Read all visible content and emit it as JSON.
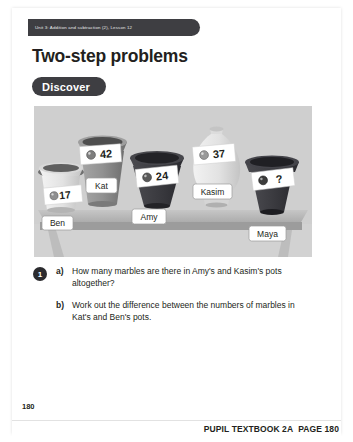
{
  "document": {
    "unit_strip": "Unit 3: Addition and subtraction (2), Lesson 12",
    "title": "Two-step problems",
    "section_label": "Discover",
    "folio": "180",
    "footer_book": "PUPIL TEXTBOOK 2A",
    "footer_page": "PAGE 180"
  },
  "illustration": {
    "name": "marble-pots-on-shelf",
    "pots": [
      {
        "id": "ben",
        "name_label": "Ben",
        "count_label": "17",
        "marble_icon": "marble-icon"
      },
      {
        "id": "kat",
        "name_label": "Kat",
        "count_label": "42",
        "marble_icon": "marble-icon"
      },
      {
        "id": "amy",
        "name_label": "Amy",
        "count_label": "24",
        "marble_icon": "marble-icon"
      },
      {
        "id": "kasim",
        "name_label": "Kasim",
        "count_label": "37",
        "marble_icon": "marble-icon"
      },
      {
        "id": "maya",
        "name_label": "Maya",
        "count_label": "?",
        "marble_icon": "marble-icon"
      }
    ]
  },
  "questions": {
    "number": "1",
    "items": [
      {
        "letter": "a)",
        "text": "How many marbles are there in Amy's and Kasim's pots altogether?"
      },
      {
        "letter": "b)",
        "text": "Work out the difference between the numbers of marbles in Kat's and Ben's pots."
      }
    ]
  },
  "colors": {
    "ink": "#231f20",
    "strip": "#3e3e42",
    "panel_bg": "#d2d2d2",
    "shelf": "#b9b9b9",
    "pot_dark": "#3b3b3f",
    "pot_mid": "#8d8d8d",
    "pot_light": "#e3e3e3"
  }
}
